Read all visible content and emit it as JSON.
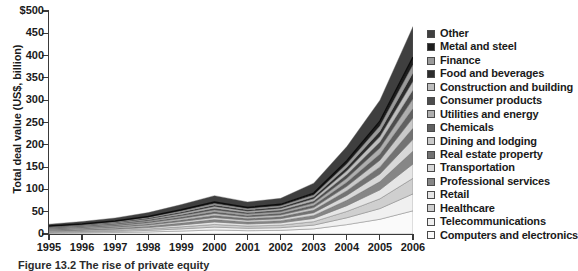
{
  "figure": {
    "caption": "Figure 13.2  The rise of private equity"
  },
  "axes": {
    "y_title": "Total deal value (US$, billion)",
    "y_ticks": [
      "$500",
      "450",
      "400",
      "350",
      "300",
      "250",
      "200",
      "150",
      "100",
      "50",
      "0"
    ],
    "x_ticks": [
      "1995",
      "1996",
      "1997",
      "1998",
      "1999",
      "2000",
      "2001",
      "2002",
      "2003",
      "2004",
      "2005",
      "2006"
    ]
  },
  "legend": {
    "position": "right",
    "items": [
      {
        "label": "Other",
        "color": "#3f3f3f"
      },
      {
        "label": "Metal and steel",
        "color": "#1e1e1e"
      },
      {
        "label": "Finance",
        "color": "#9a9a9a"
      },
      {
        "label": "Food and beverages",
        "color": "#2c2c2c"
      },
      {
        "label": "Construction and building",
        "color": "#bdbdbd"
      },
      {
        "label": "Consumer products",
        "color": "#4d4d4d"
      },
      {
        "label": "Utilities and energy",
        "color": "#aeaeae"
      },
      {
        "label": "Chemicals",
        "color": "#606060"
      },
      {
        "label": "Dining and lodging",
        "color": "#c9c9c9"
      },
      {
        "label": "Real estate property",
        "color": "#727272"
      },
      {
        "label": "Transportation",
        "color": "#d8d8d8"
      },
      {
        "label": "Professional services",
        "color": "#868686"
      },
      {
        "label": "Retail",
        "color": "#e6e6e6"
      },
      {
        "label": "Healthcare",
        "color": "#cfcfcf"
      },
      {
        "label": "Telecommunications",
        "color": "#f0f0f0"
      },
      {
        "label": "Computers and electronics",
        "color": "#fafafa"
      }
    ]
  },
  "chart_data": {
    "type": "area",
    "stacked": true,
    "title": "",
    "xlabel": "",
    "ylabel": "Total deal value (US$, billion)",
    "ylim": [
      0,
      500
    ],
    "grid": false,
    "legend_position": "right",
    "x": [
      1995,
      1996,
      1997,
      1998,
      1999,
      2000,
      2001,
      2002,
      2003,
      2004,
      2005,
      2006
    ],
    "totals": [
      22,
      28,
      36,
      48,
      66,
      86,
      72,
      80,
      110,
      196,
      300,
      465
    ],
    "series": [
      {
        "name": "Computers and electronics",
        "values": [
          2.0,
          2.6,
          3.4,
          4.6,
          6.6,
          9.0,
          7.4,
          8.2,
          11.5,
          21.0,
          33.0,
          52.0
        ]
      },
      {
        "name": "Telecommunications",
        "values": [
          1.6,
          2.0,
          2.6,
          3.5,
          4.9,
          6.5,
          5.4,
          6.0,
          8.4,
          15.4,
          24.0,
          38.0
        ]
      },
      {
        "name": "Healthcare",
        "values": [
          1.5,
          1.9,
          2.5,
          3.3,
          4.6,
          6.0,
          5.0,
          5.6,
          7.8,
          14.2,
          22.0,
          35.0
        ]
      },
      {
        "name": "Retail",
        "values": [
          1.4,
          1.8,
          2.3,
          3.1,
          4.3,
          5.6,
          4.7,
          5.2,
          7.2,
          13.0,
          20.0,
          32.0
        ]
      },
      {
        "name": "Professional services",
        "values": [
          1.3,
          1.7,
          2.2,
          2.9,
          4.0,
          5.2,
          4.4,
          4.9,
          6.7,
          12.0,
          18.5,
          29.0
        ]
      },
      {
        "name": "Transportation",
        "values": [
          1.2,
          1.6,
          2.0,
          2.7,
          3.7,
          4.8,
          4.0,
          4.5,
          6.2,
          11.0,
          17.0,
          26.5
        ]
      },
      {
        "name": "Real estate property",
        "values": [
          1.2,
          1.5,
          1.9,
          2.6,
          3.5,
          4.6,
          3.8,
          4.3,
          5.9,
          10.5,
          16.0,
          25.0
        ]
      },
      {
        "name": "Dining and lodging",
        "values": [
          1.1,
          1.4,
          1.8,
          2.4,
          3.3,
          4.3,
          3.6,
          4.0,
          5.5,
          9.8,
          15.0,
          23.0
        ]
      },
      {
        "name": "Chemicals",
        "values": [
          1.1,
          1.3,
          1.7,
          2.3,
          3.1,
          4.1,
          3.4,
          3.8,
          5.2,
          9.2,
          14.0,
          21.5
        ]
      },
      {
        "name": "Utilities and energy",
        "values": [
          1.0,
          1.3,
          1.6,
          2.2,
          3.0,
          3.9,
          3.3,
          3.6,
          5.0,
          8.8,
          13.5,
          21.0
        ]
      },
      {
        "name": "Consumer products",
        "values": [
          1.0,
          1.2,
          1.6,
          2.1,
          2.9,
          3.8,
          3.2,
          3.5,
          4.8,
          8.5,
          13.0,
          20.0
        ]
      },
      {
        "name": "Construction and building",
        "values": [
          0.9,
          1.2,
          1.5,
          2.0,
          2.8,
          3.6,
          3.0,
          3.4,
          4.6,
          8.2,
          12.5,
          19.5
        ]
      },
      {
        "name": "Food and beverages",
        "values": [
          0.9,
          1.1,
          1.5,
          2.0,
          2.7,
          3.5,
          2.9,
          3.3,
          4.5,
          7.9,
          12.0,
          19.0
        ]
      },
      {
        "name": "Finance",
        "values": [
          0.9,
          1.1,
          1.4,
          1.9,
          2.6,
          3.4,
          2.8,
          3.2,
          4.3,
          7.6,
          11.5,
          18.0
        ]
      },
      {
        "name": "Metal and steel",
        "values": [
          0.8,
          1.0,
          1.3,
          1.8,
          2.5,
          3.2,
          2.7,
          3.0,
          4.1,
          7.2,
          11.0,
          17.0
        ]
      },
      {
        "name": "Other",
        "values": [
          4.1,
          5.3,
          6.7,
          8.6,
          11.5,
          14.5,
          12.4,
          13.5,
          22.3,
          31.7,
          47.0,
          68.5
        ]
      }
    ]
  }
}
